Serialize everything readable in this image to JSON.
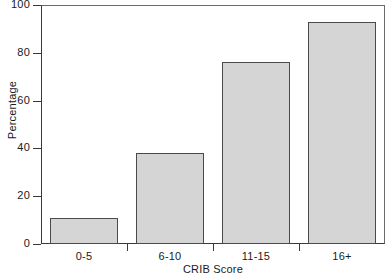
{
  "chart_data": {
    "type": "bar",
    "title": "",
    "xlabel": "CRIB Score",
    "ylabel": "Percentage",
    "categories": [
      "0-5",
      "6-10",
      "11-15",
      "16+"
    ],
    "values": [
      11,
      38,
      76,
      93
    ],
    "ylim": [
      0,
      100
    ],
    "yticks": [
      0,
      20,
      40,
      60,
      80,
      100
    ],
    "ytick_labels": [
      "0",
      "20",
      "40",
      "60",
      "80",
      "100"
    ],
    "grid": false,
    "legend": null,
    "series": [
      {
        "name": "Percentage",
        "values": [
          11,
          38,
          76,
          93
        ]
      }
    ],
    "bar_fill_color": "#d5d5d5",
    "bar_edge_color": "#4a4a4a",
    "axis_color": "#3a3a3a",
    "background_color": "#ffffff"
  },
  "figure": {
    "name": "crib-score-bar-chart"
  }
}
